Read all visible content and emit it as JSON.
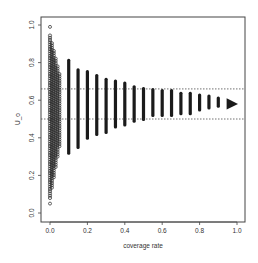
{
  "chart_data": {
    "type": "scatter",
    "title": "",
    "xlabel": "coverage rate",
    "ylabel": "U_o",
    "xlim": [
      0.0,
      1.0
    ],
    "ylim": [
      0.0,
      1.0
    ],
    "xticks": [
      "0.0",
      "0.2",
      "0.4",
      "0.6",
      "0.8",
      "1.0"
    ],
    "yticks": [
      "0.0",
      "0.2",
      "0.4",
      "0.6",
      "0.8",
      "1.0"
    ],
    "grid": false,
    "legend": null,
    "reference_lines": [
      {
        "orientation": "horizontal",
        "y": 0.66,
        "style": "dashed"
      },
      {
        "orientation": "horizontal",
        "y": 0.5,
        "style": "dashed"
      }
    ],
    "dense_cluster": {
      "description": "Dense points at coverage rate 0.0-0.05 spanning U_o ~0.05 to ~0.99",
      "x_range": [
        0.0,
        0.05
      ],
      "y_min": 0.05,
      "y_max": 0.99
    },
    "series": [
      {
        "name": "U_o range by coverage rate",
        "x": [
          0.1,
          0.15,
          0.2,
          0.25,
          0.3,
          0.35,
          0.4,
          0.45,
          0.5,
          0.55,
          0.6,
          0.65,
          0.7,
          0.75,
          0.8,
          0.85,
          0.9,
          0.95,
          1.0
        ],
        "y_min": [
          0.31,
          0.34,
          0.39,
          0.41,
          0.42,
          0.45,
          0.46,
          0.48,
          0.49,
          0.51,
          0.51,
          0.51,
          0.52,
          0.52,
          0.54,
          0.55,
          0.56,
          0.55,
          0.57
        ],
        "y_max": [
          0.82,
          0.77,
          0.76,
          0.74,
          0.72,
          0.71,
          0.7,
          0.68,
          0.67,
          0.665,
          0.66,
          0.66,
          0.645,
          0.645,
          0.635,
          0.63,
          0.62,
          0.61,
          0.59
        ]
      }
    ]
  }
}
